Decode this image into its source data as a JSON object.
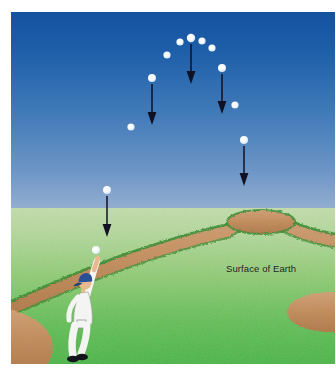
{
  "figure": {
    "labels": {
      "surface_of_earth": "Surface of Earth"
    },
    "colors": {
      "sky_top": "#1a5ba8",
      "sky_horizon": "#8fa9cd",
      "grass_near_horizon": "#bcd9a4",
      "grass_foreground": "#4cb848",
      "dirt": "#c28d5e",
      "dirt_edge": "#3f8f3a",
      "ball": "#ffffff",
      "arrow": "#111122",
      "uniform": "#f2f2f2",
      "cap": "#2b4f96",
      "skin": "#e8b98c",
      "shoes": "#14141c",
      "page_background": "#ffffff"
    },
    "layout": {
      "image_width": 336,
      "image_height": 372,
      "figure_left": 11,
      "figure_top": 12,
      "figure_width": 324,
      "figure_height": 352,
      "horizon_y": 196
    }
  },
  "scene": {
    "sky": {
      "name": "sky",
      "top_color": "#1a5ba8",
      "bottom_color": "#8fa9cd"
    },
    "ground": {
      "name": "grass-field",
      "top_color": "#bcd9a4",
      "bottom_color": "#4cb848"
    },
    "mound": {
      "name": "pitchers-mound",
      "cx": 250,
      "cy": 212,
      "rx": 34,
      "ry": 11
    },
    "player": {
      "name": "baseball-player",
      "cap_color": "#2b4f96",
      "uniform_color": "#f2f2f2",
      "x": 78,
      "y": 300
    }
  },
  "trajectory": {
    "type": "projectile-parabola",
    "description": "Ball thrown upward from player's hand, arcing over and falling back down; vertical arrows show constant downward gravitational acceleration at several points.",
    "balls": [
      {
        "id": "ball-1",
        "x": 85,
        "y": 238,
        "r": 4.0,
        "label": "ball-at-hand"
      },
      {
        "id": "ball-2",
        "x": 96,
        "y": 178,
        "r": 4.0,
        "label": "ball-rising-low"
      },
      {
        "id": "ball-3",
        "x": 120,
        "y": 115,
        "r": 3.6,
        "label": "ball-rising-mid"
      },
      {
        "id": "ball-4",
        "x": 141,
        "y": 66,
        "r": 4.0,
        "label": "ball-rising-high"
      },
      {
        "id": "ball-5",
        "x": 156,
        "y": 43,
        "r": 3.6,
        "label": "ball-near-apex-left"
      },
      {
        "id": "ball-6",
        "x": 169,
        "y": 30,
        "r": 3.6,
        "label": "ball-pre-apex"
      },
      {
        "id": "ball-7",
        "x": 180,
        "y": 26,
        "r": 4.2,
        "label": "ball-apex"
      },
      {
        "id": "ball-8",
        "x": 191,
        "y": 29,
        "r": 3.6,
        "label": "ball-post-apex"
      },
      {
        "id": "ball-9",
        "x": 201,
        "y": 36,
        "r": 3.6,
        "label": "ball-falling-high"
      },
      {
        "id": "ball-10",
        "x": 211,
        "y": 56,
        "r": 4.0,
        "label": "ball-falling-mid-high"
      },
      {
        "id": "ball-11",
        "x": 224,
        "y": 93,
        "r": 3.6,
        "label": "ball-falling-mid"
      },
      {
        "id": "ball-12",
        "x": 233,
        "y": 128,
        "r": 4.0,
        "label": "ball-falling-low"
      }
    ],
    "arrows": [
      {
        "id": "arrow-1",
        "x": 96,
        "y1": 184,
        "y2": 222,
        "label": "gravity-arrow-left-low"
      },
      {
        "id": "arrow-2",
        "x": 141,
        "y1": 72,
        "y2": 110,
        "label": "gravity-arrow-left-high"
      },
      {
        "id": "arrow-3",
        "x": 180,
        "y1": 32,
        "y2": 70,
        "label": "gravity-arrow-apex"
      },
      {
        "id": "arrow-4",
        "x": 211,
        "y1": 62,
        "y2": 100,
        "label": "gravity-arrow-right-high"
      },
      {
        "id": "arrow-5",
        "x": 233,
        "y1": 134,
        "y2": 172,
        "label": "gravity-arrow-right-low"
      }
    ]
  }
}
